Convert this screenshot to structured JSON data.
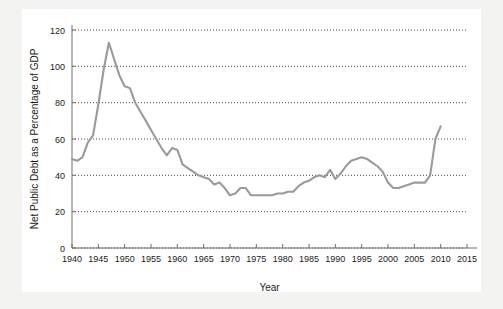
{
  "figure": {
    "background_color": "#f3f3f1",
    "card_color": "#ffffff",
    "line_color": "#9a9a9a",
    "axis_color": "#6e6e6e",
    "grid_color": "#4a4a4a",
    "text_color": "#1a1a1a"
  },
  "chart_data": {
    "type": "line",
    "title": "",
    "subtitle": "",
    "xlabel": "Year",
    "ylabel": "Net Public Debt as a Percentage of GDP",
    "xlim": [
      1940,
      2015
    ],
    "ylim": [
      0,
      120
    ],
    "grid": true,
    "grid_axis": "y",
    "legend": false,
    "legend_position": "none",
    "xticks": [
      1940,
      1945,
      1950,
      1955,
      1960,
      1965,
      1970,
      1975,
      1980,
      1985,
      1990,
      1995,
      2000,
      2005,
      2010,
      2015
    ],
    "xtick_labels": [
      "1940",
      "1945",
      "1950",
      "1955",
      "1960",
      "1965",
      "1970",
      "1975",
      "1980",
      "1985",
      "1990",
      "1995",
      "2000",
      "2005",
      "2010",
      "2015"
    ],
    "yticks": [
      0,
      20,
      40,
      60,
      80,
      100,
      120
    ],
    "ytick_labels": [
      "0",
      "20",
      "40",
      "60",
      "80",
      "100",
      "120"
    ],
    "series": [
      {
        "name": "Net Public Debt as a Percentage of GDP",
        "color": "#9a9a9a",
        "x": [
          1940,
          1941,
          1942,
          1943,
          1944,
          1945,
          1946,
          1947,
          1948,
          1949,
          1950,
          1951,
          1952,
          1953,
          1954,
          1955,
          1956,
          1957,
          1958,
          1959,
          1960,
          1961,
          1962,
          1963,
          1964,
          1965,
          1966,
          1967,
          1968,
          1969,
          1970,
          1971,
          1972,
          1973,
          1974,
          1975,
          1976,
          1977,
          1978,
          1979,
          1980,
          1981,
          1982,
          1983,
          1984,
          1985,
          1986,
          1987,
          1988,
          1989,
          1990,
          1991,
          1992,
          1993,
          1994,
          1995,
          1996,
          1997,
          1998,
          1999,
          2000,
          2001,
          2002,
          2003,
          2004,
          2005,
          2006,
          2007,
          2008,
          2009,
          2010
        ],
        "y": [
          49,
          48,
          50,
          58,
          62,
          79,
          98,
          113,
          104,
          95,
          89,
          88,
          80,
          75,
          70,
          65,
          60,
          55,
          51,
          55,
          54,
          46,
          44,
          42,
          40,
          39,
          38,
          35,
          36,
          33,
          29,
          30,
          33,
          33,
          29,
          29,
          29,
          29,
          29,
          30,
          30,
          31,
          31,
          34,
          36,
          37,
          39,
          40,
          39,
          43,
          38,
          41,
          45,
          48,
          49,
          50,
          49,
          47,
          45,
          42,
          36,
          33,
          33,
          34,
          35,
          36,
          36,
          36,
          40,
          60,
          67
        ]
      }
    ]
  }
}
